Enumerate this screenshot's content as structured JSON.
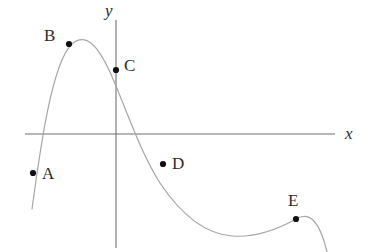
{
  "figure": {
    "width": 373,
    "height": 252,
    "background": "#ffffff",
    "curve_color": "#a6a6a6",
    "axis_color": "#6f6f6f",
    "point_color": "#111111",
    "label_color": "#2b2b2b"
  },
  "axes": {
    "x_axis": {
      "label": "x",
      "label_x": 345,
      "label_y": 125,
      "x_start": 25,
      "x_end": 335,
      "y": 134
    },
    "y_axis": {
      "label": "y",
      "label_x": 105,
      "label_y": 2,
      "x": 116,
      "y_start": 20,
      "y_end": 248
    },
    "origin": {
      "x": 116,
      "y": 134
    }
  },
  "chart_data": {
    "type": "line",
    "title": "",
    "xlabel": "x",
    "ylabel": "y",
    "grid": false,
    "legend": "none",
    "curve_path": "M 32,209 C 40,150 52,62 72,44 C 86,32 98,46 110,72 C 126,108 140,152 160,183 C 182,216 206,234 232,236 C 258,238 280,228 296,219 C 310,211 320,222 327,252",
    "curve_points": [
      {
        "x": 32,
        "y": 209,
        "role": "left-endpoint"
      },
      {
        "x": 38,
        "y": 134,
        "role": "x-intercept-left"
      },
      {
        "x": 69,
        "y": 44,
        "role": "point-B"
      },
      {
        "x": 83,
        "y": 37,
        "role": "local-maximum"
      },
      {
        "x": 116,
        "y": 70,
        "role": "y-intercept-point-C"
      },
      {
        "x": 147,
        "y": 134,
        "role": "x-intercept-right"
      },
      {
        "x": 163,
        "y": 164,
        "role": "point-D"
      },
      {
        "x": 232,
        "y": 236,
        "role": "local-minimum"
      },
      {
        "x": 296,
        "y": 219,
        "role": "point-E-local-maximum"
      },
      {
        "x": 327,
        "y": 252,
        "role": "right-endpoint"
      }
    ],
    "labeled_points": [
      {
        "id": "A",
        "label": "A",
        "dot_x": 33,
        "dot_y": 173,
        "label_x": 42,
        "label_y": 165,
        "label_position": "right"
      },
      {
        "id": "B",
        "label": "B",
        "dot_x": 69,
        "dot_y": 44,
        "label_x": 44,
        "label_y": 27,
        "label_position": "upper-left"
      },
      {
        "id": "C",
        "label": "C",
        "dot_x": 116,
        "dot_y": 70,
        "label_x": 124,
        "label_y": 57,
        "label_position": "right"
      },
      {
        "id": "D",
        "label": "D",
        "dot_x": 163,
        "dot_y": 164,
        "label_x": 172,
        "label_y": 155,
        "label_position": "right"
      },
      {
        "id": "E",
        "label": "E",
        "dot_x": 296,
        "dot_y": 219,
        "label_x": 288,
        "label_y": 192,
        "label_position": "above"
      }
    ],
    "axis_ranges": {
      "xlim": [
        25,
        335
      ],
      "ylim": [
        20,
        248
      ]
    }
  }
}
